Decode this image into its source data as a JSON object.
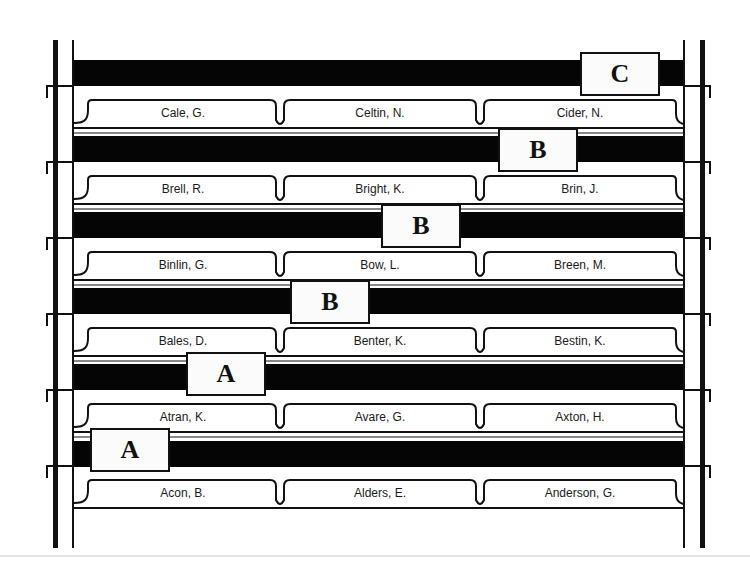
{
  "diagram": {
    "type": "filing-drawer-guides",
    "rows": [
      {
        "guide": "C",
        "folders": [
          "Cale, G.",
          "Celtin, N.",
          "Cider, N."
        ]
      },
      {
        "guide": "B",
        "folders": [
          "Brell, R.",
          "Bright, K.",
          "Brin, J."
        ]
      },
      {
        "guide": "B",
        "folders": [
          "Binlin, G.",
          "Bow, L.",
          "Breen, M."
        ]
      },
      {
        "guide": "B",
        "folders": [
          "Bales, D.",
          "Benter, K.",
          "Bestin, K."
        ]
      },
      {
        "guide": "A",
        "folders": [
          "Atran, K.",
          "Avare, G.",
          "Axton, H."
        ]
      },
      {
        "guide": "A",
        "folders": [
          "Acon, B.",
          "Alders, E.",
          "Anderson, G."
        ]
      }
    ]
  },
  "colors": {
    "ink": "#111111",
    "bar": "#050505",
    "paper": "#ffffff"
  }
}
